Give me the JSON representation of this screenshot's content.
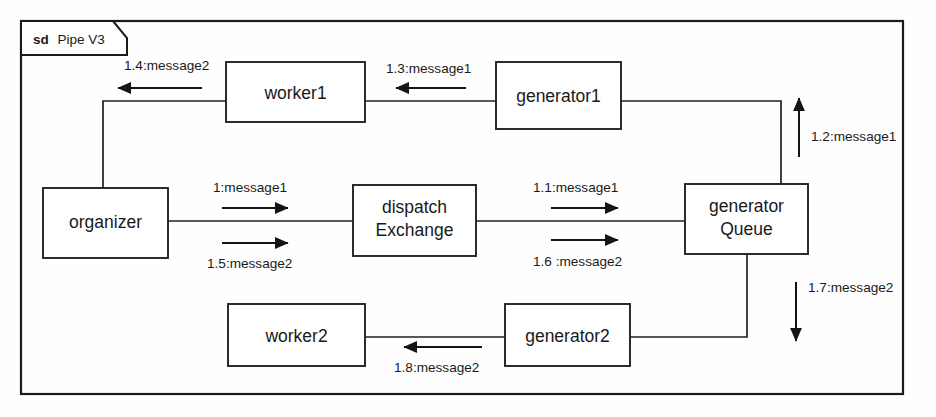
{
  "frame": {
    "tab_keyword": "sd",
    "tab_name": "Pipe V3"
  },
  "nodes": [
    {
      "id": "worker1",
      "label": "worker1"
    },
    {
      "id": "generator1",
      "label": "generator1"
    },
    {
      "id": "organizer",
      "label": "organizer"
    },
    {
      "id": "dispatchExchange",
      "label_line1": "dispatch",
      "label_line2": "Exchange"
    },
    {
      "id": "generatorQueue",
      "label_line1": "generator",
      "label_line2": "Queue"
    },
    {
      "id": "worker2",
      "label": "worker2"
    },
    {
      "id": "generator2",
      "label": "generator2"
    }
  ],
  "messages": [
    {
      "id": "m1",
      "label": "1:message1",
      "direction": "right",
      "from": "organizer",
      "to": "dispatchExchange"
    },
    {
      "id": "m1_1",
      "label": "1.1:message1",
      "direction": "right",
      "from": "dispatchExchange",
      "to": "generatorQueue"
    },
    {
      "id": "m1_2",
      "label": "1.2:message1",
      "direction": "up",
      "from": "generatorQueue",
      "to": "generator1"
    },
    {
      "id": "m1_3",
      "label": "1.3:message1",
      "direction": "left",
      "from": "generator1",
      "to": "worker1"
    },
    {
      "id": "m1_4",
      "label": "1.4:message2",
      "direction": "left",
      "from": "worker1",
      "to": "organizer"
    },
    {
      "id": "m1_5",
      "label": "1.5:message2",
      "direction": "right",
      "from": "organizer",
      "to": "dispatchExchange"
    },
    {
      "id": "m1_6",
      "label": "1.6 :message2",
      "direction": "right",
      "from": "dispatchExchange",
      "to": "generatorQueue"
    },
    {
      "id": "m1_7",
      "label": "1.7:message2",
      "direction": "down",
      "from": "generatorQueue",
      "to": "generator2"
    },
    {
      "id": "m1_8",
      "label": "1.8:message2",
      "direction": "left",
      "from": "generator2",
      "to": "worker2"
    }
  ],
  "colors": {
    "stroke": "#1a1a1a",
    "fill": "#ffffff",
    "background": "#fefefe"
  }
}
